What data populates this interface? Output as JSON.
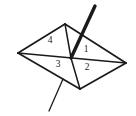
{
  "figure": {
    "kind": "geometry-diagram",
    "canvas": {
      "width": 136,
      "height": 116
    },
    "colors": {
      "background": "#ffffff",
      "stroke": "#1a1a1a",
      "label": "#1a1a1a"
    },
    "vertices": {
      "left": {
        "name": "left-vertex",
        "x": 18,
        "y": 53
      },
      "top": {
        "name": "top-vertex",
        "x": 65,
        "y": 24
      },
      "right": {
        "name": "right-vertex",
        "x": 126,
        "y": 63
      },
      "bottom": {
        "name": "bottom-vertex",
        "x": 80,
        "y": 89
      },
      "center": {
        "name": "center-vertex",
        "x": 71,
        "y": 58
      }
    },
    "quad_edges": [
      {
        "name": "edge-left-top",
        "from": "left",
        "to": "top"
      },
      {
        "name": "edge-top-right",
        "from": "top",
        "to": "right"
      },
      {
        "name": "edge-right-bottom",
        "from": "right",
        "to": "bottom"
      },
      {
        "name": "edge-bottom-left",
        "from": "bottom",
        "to": "left"
      }
    ],
    "diagonals": [
      {
        "name": "diagonal-left-right",
        "from": "left",
        "to": "right"
      },
      {
        "name": "diagonal-top-center",
        "from": "top",
        "to": "center"
      },
      {
        "name": "diagonal-center-bottom",
        "from": "center",
        "to": "bottom"
      }
    ],
    "rays": [
      {
        "name": "thick-ray",
        "weight": "thick",
        "from": {
          "x": 95,
          "y": 6
        },
        "to": {
          "x": 71,
          "y": 58
        }
      },
      {
        "name": "thin-ray",
        "weight": "thin",
        "from": {
          "x": 63,
          "y": 79
        },
        "to": {
          "x": 49,
          "y": 111
        }
      }
    ],
    "labels": [
      {
        "name": "region-label-4",
        "text": "4",
        "x": 50,
        "y": 41,
        "region": "upper-left-triangle"
      },
      {
        "name": "region-label-1",
        "text": "1",
        "x": 86,
        "y": 50,
        "region": "upper-right-triangle"
      },
      {
        "name": "region-label-3",
        "text": "3",
        "x": 58,
        "y": 65,
        "region": "lower-left-triangle"
      },
      {
        "name": "region-label-2",
        "text": "2",
        "x": 87,
        "y": 68,
        "region": "lower-right-triangle"
      }
    ]
  }
}
